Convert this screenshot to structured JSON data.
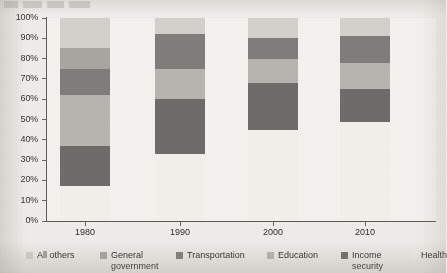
{
  "chart_data": {
    "type": "bar",
    "subtype": "stacked-percent",
    "title": "",
    "xlabel": "",
    "ylabel": "",
    "categories": [
      "1980",
      "1990",
      "2000",
      "2010"
    ],
    "ylim": [
      0,
      100
    ],
    "y_ticks": [
      "0%",
      "10%",
      "20%",
      "30%",
      "40%",
      "50%",
      "60%",
      "70%",
      "80%",
      "90%",
      "100%"
    ],
    "y_tick_values": [
      0,
      10,
      20,
      30,
      40,
      50,
      60,
      70,
      80,
      90,
      100
    ],
    "grid": false,
    "legend_position": "bottom",
    "stack_order_bottom_to_top": [
      "Health",
      "Income security",
      "Education",
      "Transportation",
      "General government",
      "All others"
    ],
    "series": [
      {
        "name": "All others",
        "color": "#d3d2cd",
        "values": [
          15,
          8,
          10,
          9
        ]
      },
      {
        "name": "General government",
        "color": "#a8a7a2",
        "values": [
          10,
          0,
          0,
          0
        ]
      },
      {
        "name": "Transportation",
        "color": "#7f7e7a",
        "values": [
          13,
          17,
          10,
          13
        ]
      },
      {
        "name": "Education",
        "color": "#b7b6b1",
        "values": [
          25,
          15,
          12,
          13
        ]
      },
      {
        "name": "Income security",
        "color": "#6e6d69",
        "values": [
          20,
          27,
          23,
          16
        ]
      },
      {
        "name": "Health",
        "color": "#f2f1ec",
        "values": [
          17,
          33,
          45,
          49
        ]
      }
    ],
    "bar_boundaries_percent": {
      "1980": {
        "Health": [
          0,
          17
        ],
        "Income security": [
          17,
          37
        ],
        "Education": [
          37,
          62
        ],
        "Transportation": [
          62,
          75
        ],
        "General government": [
          75,
          85
        ],
        "All others": [
          85,
          100
        ]
      },
      "1990": {
        "Health": [
          0,
          33
        ],
        "Income security": [
          33,
          60
        ],
        "Education": [
          60,
          75
        ],
        "Transportation": [
          75,
          92
        ],
        "General government": [
          92,
          92
        ],
        "All others": [
          92,
          100
        ]
      },
      "2000": {
        "Health": [
          0,
          45
        ],
        "Income security": [
          45,
          68
        ],
        "Education": [
          68,
          80
        ],
        "Transportation": [
          80,
          90
        ],
        "General government": [
          90,
          90
        ],
        "All others": [
          90,
          100
        ]
      },
      "2010": {
        "Health": [
          0,
          49
        ],
        "Income security": [
          49,
          65
        ],
        "Education": [
          65,
          78
        ],
        "Transportation": [
          78,
          91
        ],
        "General government": [
          91,
          91
        ],
        "All others": [
          91,
          100
        ]
      }
    }
  },
  "legend": {
    "items": [
      {
        "label": "All others",
        "color": "#d3d2cd"
      },
      {
        "label": "General\ngovernment",
        "color": "#a8a7a2"
      },
      {
        "label": "Transportation",
        "color": "#7f7e7a"
      },
      {
        "label": "Education",
        "color": "#b7b6b1"
      },
      {
        "label": "Income\nsecurity",
        "color": "#6e6d69"
      },
      {
        "label": "Health",
        "color": "#f2f1ec"
      }
    ]
  },
  "colors": {
    "page_background": "#efeeea",
    "plot_background": "#f4f3ef",
    "axis": "#5d5a55",
    "text": "#2f2d2a"
  }
}
